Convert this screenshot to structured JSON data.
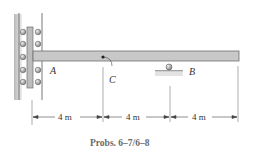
{
  "figure": {
    "caption": "Probs. 6–7/6–8",
    "labels": {
      "A": "A",
      "B": "B",
      "C": "C"
    },
    "dimensions": [
      "4 m",
      "4 m",
      "4 m"
    ],
    "colors": {
      "beam": "#c8c8c8",
      "beam_edge": "#6e6e6e",
      "wall": "#b0b0b0",
      "roller": "#9a9a9a",
      "line": "#555555"
    }
  }
}
